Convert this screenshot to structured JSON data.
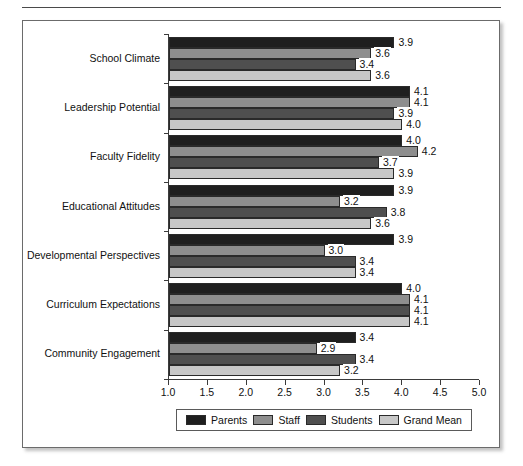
{
  "chart_data": {
    "type": "bar",
    "orientation": "horizontal",
    "title": "",
    "xlabel": "",
    "ylabel": "",
    "xlim": [
      1.0,
      5.0
    ],
    "xticks": [
      "1.0",
      "1.5",
      "2.0",
      "2.5",
      "3.0",
      "3.5",
      "4.0",
      "4.5",
      "5.0"
    ],
    "grid": false,
    "legend_position": "bottom",
    "categories": [
      "School Climate",
      "Leadership Potential",
      "Faculty Fidelity",
      "Educational Attitudes",
      "Developmental Perspectives",
      "Curriculum Expectations",
      "Community Engagement"
    ],
    "series": [
      {
        "name": "Parents",
        "color": "#1f1f1f",
        "values": [
          3.9,
          4.1,
          4.0,
          3.9,
          3.9,
          4.0,
          3.4
        ],
        "labels": [
          "3.9",
          "4.1",
          "4.0",
          "3.9",
          "3.9",
          "4.0",
          "3.4"
        ]
      },
      {
        "name": "Staff",
        "color": "#8e8e8e",
        "values": [
          3.6,
          4.1,
          4.2,
          3.2,
          3.0,
          4.1,
          2.9
        ],
        "labels": [
          "3.6",
          "4.1",
          "4.2",
          "3.2",
          "3.0",
          "4.1",
          "2.9"
        ]
      },
      {
        "name": "Students",
        "color": "#4f4f4f",
        "values": [
          3.4,
          3.9,
          3.7,
          3.8,
          3.4,
          4.1,
          3.4
        ],
        "labels": [
          "3.4",
          "3.9",
          "3.7",
          "3.8",
          "3.4",
          "4.1",
          "3.4"
        ]
      },
      {
        "name": "Grand Mean",
        "color": "#c7c7c7",
        "values": [
          3.6,
          4.0,
          3.9,
          3.6,
          3.4,
          4.1,
          3.2
        ],
        "labels": [
          "3.6",
          "4.0",
          "3.9",
          "3.6",
          "3.4",
          "4.1",
          "3.2"
        ]
      }
    ]
  },
  "legend": {
    "items": [
      {
        "label": "Parents",
        "swatch": "parents"
      },
      {
        "label": "Staff",
        "swatch": "staff"
      },
      {
        "label": "Students",
        "swatch": "students"
      },
      {
        "label": "Grand Mean",
        "swatch": "grandmean"
      }
    ]
  }
}
